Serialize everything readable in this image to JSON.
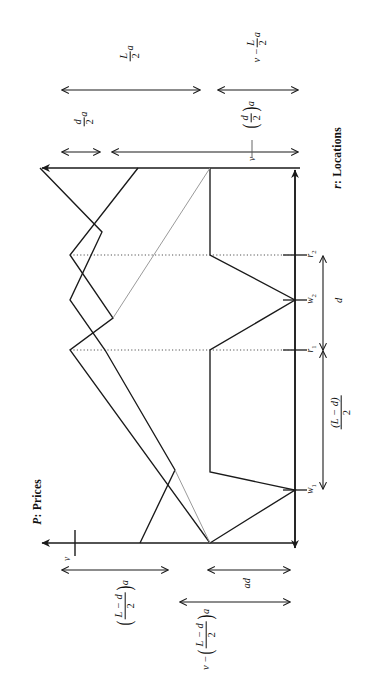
{
  "figure": {
    "kind": "rotated-line-diagram",
    "orientation_note": "whole figure drawn rotated 90 degrees counter-clockwise",
    "background_color": "#ffffff",
    "line_color": "#1a1a1a",
    "dotted_color": "#555555"
  },
  "axes": {
    "price_axis": {
      "title": "P: Prices",
      "title_parts": {
        "symbol": "P",
        "name": ": Prices"
      },
      "arrow_direction": "increasing-left-in-image"
    },
    "location_axis": {
      "title": "r: Locations",
      "title_parts": {
        "symbol": "r",
        "name": ": Locations"
      },
      "arrow_direction": "increasing-up-in-image"
    }
  },
  "ticks": {
    "location": [
      {
        "id": "r2",
        "label": "r",
        "sub": "2"
      },
      {
        "id": "w2",
        "label": "w",
        "sub": "2"
      },
      {
        "id": "r1",
        "label": "r",
        "sub": "1"
      },
      {
        "id": "w1",
        "label": "w",
        "sub": "1"
      }
    ],
    "price": [
      {
        "id": "v",
        "label": "v"
      },
      {
        "id": "v_top",
        "label": "v"
      }
    ]
  },
  "dimensions": {
    "loc_d": {
      "text": "d",
      "description": "distance between r1 and r2"
    },
    "loc_L_minus_d_over_2": {
      "num": "(L − d)",
      "den": "2",
      "description": "distance from origin up to r1"
    },
    "top_L_over_2_a": {
      "num": "L",
      "den": "2",
      "suffix": "a",
      "description": "upper-left dimension on price axis"
    },
    "top_d_over_2_a": {
      "num": "d",
      "den": "2",
      "suffix": "a",
      "description": "small dimension at far left of price axis"
    },
    "top_v_minus_L_over_2_a": {
      "lead": "v −",
      "num": "L",
      "den": "2",
      "suffix": "a",
      "description": "upper-right dimension on price axis"
    },
    "top_d_over_2_a_paren": {
      "num": "d",
      "den": "2",
      "suffix": "a",
      "parenthesized": true,
      "description": "circled/parenthesised (d/2) a just left of v tick"
    },
    "bottom_L_minus_d_over_2_a": {
      "num": "L − d",
      "den": "2",
      "suffix": "a",
      "parenthesized": true,
      "description": "lower dimension from v leftwards"
    },
    "bottom_v_minus_L_minus_d_over_2_a": {
      "lead": "v −",
      "num": "L − d",
      "den": "2",
      "suffix": "a",
      "parenthesized": true,
      "description": "lower-right long dimension"
    },
    "bottom_ad": {
      "text": "ad",
      "description": "short dimension at the origin end of the price axis"
    }
  },
  "series": {
    "solid_schedule_a": {
      "style": "solid",
      "points": [
        [
          40,
          168
        ],
        [
          102,
          232
        ],
        [
          70,
          300
        ],
        [
          105,
          350
        ],
        [
          140,
          410
        ],
        [
          175,
          470
        ],
        [
          140,
          543
        ]
      ]
    },
    "solid_schedule_b": {
      "style": "solid",
      "points": [
        [
          138,
          168
        ],
        [
          70,
          255
        ],
        [
          113,
          318
        ],
        [
          70,
          350
        ],
        [
          210,
          543
        ]
      ]
    },
    "solid_schedule_c": {
      "style": "solid",
      "points": [
        [
          210,
          168
        ],
        [
          210,
          255
        ],
        [
          295,
          300
        ],
        [
          210,
          350
        ],
        [
          210,
          472
        ],
        [
          295,
          490
        ],
        [
          210,
          543
        ]
      ]
    },
    "dotted_guide_r2": {
      "style": "dotted",
      "points": [
        [
          70,
          255
        ],
        [
          295,
          255
        ]
      ]
    },
    "dotted_guide_r1": {
      "style": "dotted",
      "points": [
        [
          70,
          350
        ],
        [
          295,
          350
        ]
      ]
    },
    "faint_diagonal": {
      "style": "faint",
      "points": [
        [
          113,
          318
        ],
        [
          210,
          168
        ]
      ]
    },
    "faint_short": {
      "style": "faint",
      "points": [
        [
          175,
          470
        ],
        [
          210,
          543
        ]
      ]
    }
  }
}
